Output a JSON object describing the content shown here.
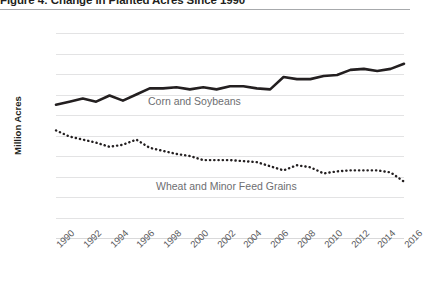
{
  "figure": {
    "title": "Figure 4: Change in Planted Acres Since 1990",
    "y_axis_title": "Million Acres"
  },
  "labels": {
    "corn_soybeans": "Corn and Soybeans",
    "wheat_grains": "Wheat and Minor Feed Grains"
  },
  "colors": {
    "line": "#231f20",
    "gridline": "#e3e3e4",
    "tick_text": "#58595b",
    "inline_label": "#6d6e71",
    "rule": "#a7a9ac"
  },
  "chart_data": {
    "type": "line",
    "title": "Figure 4: Change in Planted Acres Since 1990",
    "xlabel": "",
    "ylabel": "Million Acres",
    "ylim": [
      0,
      200
    ],
    "yticks": [
      0,
      20,
      40,
      60,
      80,
      100,
      120,
      140,
      160,
      180,
      200
    ],
    "ytick_labels": [
      "0",
      "20",
      "40",
      "60",
      "80",
      "100",
      "120",
      "140",
      "160",
      "180",
      "200"
    ],
    "xlim": [
      1990,
      2016
    ],
    "xticks": [
      1990,
      1992,
      1994,
      1996,
      1998,
      2000,
      2002,
      2004,
      2006,
      2008,
      2010,
      2012,
      2014,
      2016
    ],
    "xtick_labels": [
      "1990",
      "1992",
      "1994",
      "1996",
      "1998",
      "2000",
      "2002",
      "2004",
      "2006",
      "2008",
      "2010",
      "2012",
      "2014",
      "2016"
    ],
    "grid": true,
    "grid_axis": "y",
    "legend": "inline-annotations",
    "x": [
      1990,
      1991,
      1992,
      1993,
      1994,
      1995,
      1996,
      1997,
      1998,
      1999,
      2000,
      2001,
      2002,
      2003,
      2004,
      2005,
      2006,
      2007,
      2008,
      2009,
      2010,
      2011,
      2012,
      2013,
      2014,
      2015,
      2016
    ],
    "series": [
      {
        "name": "Corn and Soybeans",
        "style": "solid",
        "values": [
          130,
          133,
          136,
          133,
          139,
          134,
          140,
          146,
          146,
          147,
          145,
          147,
          145,
          148,
          148,
          146,
          145,
          157,
          155,
          155,
          158,
          159,
          164,
          165,
          163,
          165,
          170
        ]
      },
      {
        "name": "Wheat and Minor Feed Grains",
        "style": "dotted",
        "values": [
          105,
          99,
          96,
          93,
          89,
          91,
          96,
          88,
          85,
          82,
          80,
          76,
          76,
          76,
          75,
          74,
          70,
          66,
          71,
          69,
          63,
          65,
          66,
          66,
          66,
          64,
          55
        ]
      }
    ],
    "annotations": [
      {
        "text": "Corn and Soybeans",
        "x": 1997,
        "y": 132
      },
      {
        "text": "Wheat and Minor Feed Grains",
        "x": 1998,
        "y": 48
      }
    ]
  }
}
